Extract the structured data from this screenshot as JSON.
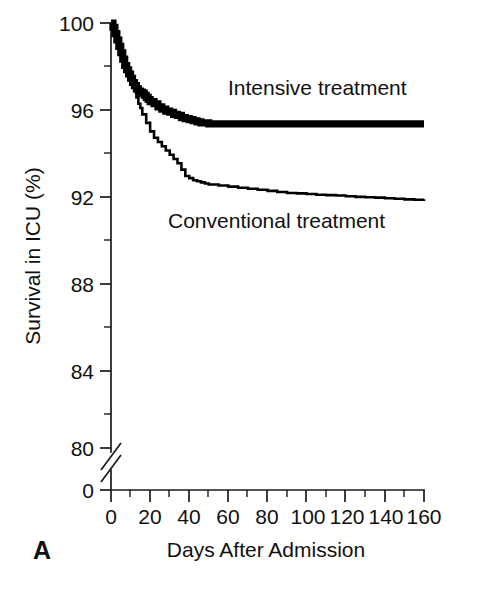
{
  "figure": {
    "panel_label": "A",
    "background_color": "#ffffff",
    "ink_color": "#000000"
  },
  "chart_data": {
    "type": "line",
    "title": "",
    "subtitle": "",
    "xlabel": "Days After Admission",
    "ylabel": "Survival in ICU (%)",
    "xlim": [
      0,
      160
    ],
    "ylim": [
      80,
      100
    ],
    "y_axis_break": true,
    "y_axis_break_note": "axis broken between 0 and 80",
    "grid": false,
    "legend_position": "inline-annotations",
    "xticks": [
      0,
      20,
      40,
      60,
      80,
      100,
      120,
      140,
      160
    ],
    "xtick_labels": [
      "0",
      "20",
      "40",
      "60",
      "80",
      "100",
      "120",
      "140",
      "160"
    ],
    "x_minor_tick_interval": 10,
    "yticks": [
      0,
      80,
      84,
      88,
      92,
      96,
      100
    ],
    "ytick_labels": [
      "0",
      "80",
      "84",
      "88",
      "92",
      "96",
      "100"
    ],
    "y_minor_ticks": [
      82,
      86,
      90,
      94,
      98
    ],
    "annotations": [
      {
        "text": "Intensive treatment",
        "x": 60,
        "y": 96.8
      },
      {
        "text": "Conventional treatment",
        "x": 55,
        "y": 92.0
      }
    ],
    "series": [
      {
        "name": "Intensive treatment",
        "style": "thick-step",
        "line_width_px": 7.2,
        "x": [
          0,
          1,
          2,
          3,
          4,
          5,
          6,
          7,
          8,
          9,
          10,
          11,
          12,
          13,
          14,
          15,
          16,
          17,
          18,
          19,
          20,
          22,
          24,
          26,
          28,
          30,
          32,
          34,
          36,
          38,
          40,
          42,
          44,
          46,
          48,
          50,
          55,
          60,
          70,
          80,
          90,
          100,
          110,
          120,
          130,
          140,
          150,
          160
        ],
        "values": [
          100.0,
          99.8,
          99.5,
          99.2,
          98.9,
          98.6,
          98.3,
          98.0,
          97.8,
          97.6,
          97.4,
          97.2,
          97.05,
          96.9,
          96.8,
          96.75,
          96.7,
          96.6,
          96.5,
          96.4,
          96.3,
          96.2,
          96.05,
          95.95,
          95.85,
          95.8,
          95.7,
          95.65,
          95.55,
          95.5,
          95.45,
          95.4,
          95.35,
          95.3,
          95.3,
          95.25,
          95.25,
          95.25,
          95.25,
          95.25,
          95.25,
          95.25,
          95.25,
          95.25,
          95.25,
          95.25,
          95.25,
          95.25
        ]
      },
      {
        "name": "Conventional treatment",
        "style": "thin-step",
        "line_width_px": 2.6,
        "x": [
          0,
          1,
          2,
          3,
          4,
          5,
          6,
          7,
          8,
          9,
          10,
          11,
          12,
          13,
          14,
          15,
          16,
          18,
          20,
          22,
          24,
          26,
          28,
          30,
          32,
          34,
          36,
          38,
          40,
          42,
          44,
          46,
          48,
          50,
          55,
          60,
          65,
          70,
          75,
          80,
          85,
          90,
          95,
          100,
          105,
          110,
          115,
          120,
          125,
          130,
          135,
          140,
          145,
          150,
          155,
          160
        ],
        "values": [
          100.0,
          99.8,
          99.5,
          99.2,
          98.9,
          98.6,
          98.3,
          98.0,
          97.7,
          97.4,
          97.2,
          97.0,
          96.8,
          96.5,
          96.2,
          96.0,
          95.7,
          95.3,
          94.9,
          94.6,
          94.4,
          94.2,
          94.0,
          93.8,
          93.6,
          93.4,
          93.1,
          92.8,
          92.7,
          92.6,
          92.55,
          92.5,
          92.45,
          92.4,
          92.35,
          92.3,
          92.25,
          92.2,
          92.15,
          92.1,
          92.05,
          92.0,
          91.98,
          91.95,
          91.92,
          91.9,
          91.88,
          91.85,
          91.82,
          91.8,
          91.78,
          91.75,
          91.73,
          91.7,
          91.68,
          91.7
        ]
      }
    ]
  }
}
